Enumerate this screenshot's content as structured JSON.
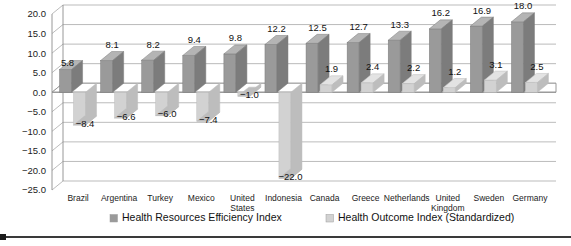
{
  "chart_data": {
    "type": "bar",
    "title": "",
    "subtitle": "",
    "xlabel": "",
    "ylabel": "",
    "ylim": [
      -25.0,
      20.0
    ],
    "ytick_step": 5.0,
    "yticks": [
      "20.0",
      "15.0",
      "10.0",
      "5.0",
      "0.0",
      "-5.0",
      "-10.0",
      "-15.0",
      "-20.0",
      "-25.0"
    ],
    "ytick_values": [
      20.0,
      15.0,
      10.0,
      5.0,
      0.0,
      -5.0,
      -10.0,
      -15.0,
      -20.0,
      -25.0
    ],
    "grid": true,
    "legend_position": "bottom",
    "style": "3d-column",
    "categories": [
      "Brazil",
      "Argentina",
      "Turkey",
      "Mexico",
      "United States",
      "Indonesia",
      "Canada",
      "Greece",
      "Netherlands",
      "United Kingdom",
      "Sweden",
      "Germany"
    ],
    "category_lines": [
      [
        "Brazil"
      ],
      [
        "Argentina"
      ],
      [
        "Turkey"
      ],
      [
        "Mexico"
      ],
      [
        "United",
        "States"
      ],
      [
        "Indonesia"
      ],
      [
        "Canada"
      ],
      [
        "Greece"
      ],
      [
        "Netherlands"
      ],
      [
        "United",
        "Kingdom"
      ],
      [
        "Sweden"
      ],
      [
        "Germany"
      ]
    ],
    "series": [
      {
        "name": "Health Resources Efficiency Index",
        "color": "#9a9a9a",
        "values": [
          5.8,
          8.1,
          8.2,
          9.4,
          9.8,
          12.2,
          12.5,
          12.7,
          13.3,
          16.2,
          16.9,
          18.0
        ],
        "labels": [
          "5.8",
          "8.1",
          "8.2",
          "9.4",
          "9.8",
          "12.2",
          "12.5",
          "12.7",
          "13.3",
          "16.2",
          "16.9",
          "18.0"
        ]
      },
      {
        "name": "Health Outcome Index (Standardized)",
        "color": "#d2d2d2",
        "values": [
          -8.4,
          -6.6,
          -6.0,
          -7.4,
          -1.0,
          -22.0,
          1.9,
          2.4,
          2.2,
          1.2,
          3.1,
          2.5
        ],
        "labels": [
          "-8.4",
          "-6.6",
          "-6.0",
          "-7.4",
          "-1.0",
          "-22.0",
          "1.9",
          "2.4",
          "2.2",
          "1.2",
          "3.1",
          "2.5"
        ]
      }
    ]
  },
  "legend": {
    "items": [
      {
        "label": "Health Resources Efficiency Index",
        "swatch": "#9a9a9a"
      },
      {
        "label": "Health Outcome Index (Standardized)",
        "swatch": "#d2d2d2"
      }
    ]
  },
  "colors": {
    "series1": "#9a9a9a",
    "series1_top": "#b4b4b4",
    "series1_side": "#7c7c7c",
    "series2": "#d2d2d2",
    "series2_top": "#e3e3e3",
    "series2_side": "#bdbdbd",
    "grid": "#a9a9a9",
    "axis": "#8d8d8d",
    "text": "#1a1a1a",
    "background": "#ffffff",
    "rule": "#3a3a3a"
  }
}
